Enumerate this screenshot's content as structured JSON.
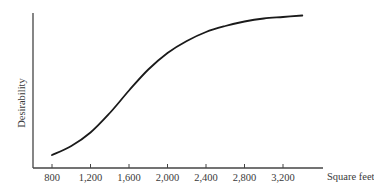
{
  "chart_data": {
    "type": "line",
    "title": "",
    "xlabel": "Square feet",
    "ylabel": "Desirability",
    "x_ticks": [
      800,
      1200,
      1600,
      2000,
      2400,
      2800,
      3200
    ],
    "x_tick_labels": [
      "800",
      "1,200",
      "1,600",
      "2,000",
      "2,400",
      "2,800",
      "3,200"
    ],
    "y_ticks": [],
    "xlim": [
      600,
      3600
    ],
    "ylim": [
      0,
      1
    ],
    "grid": false,
    "legend": null,
    "series": [
      {
        "name": "Desirability",
        "x": [
          800,
          1000,
          1200,
          1400,
          1600,
          1800,
          2000,
          2200,
          2400,
          2600,
          2800,
          3000,
          3200,
          3400
        ],
        "y": [
          0.06,
          0.12,
          0.21,
          0.34,
          0.49,
          0.63,
          0.74,
          0.82,
          0.88,
          0.92,
          0.95,
          0.97,
          0.98,
          0.99
        ]
      }
    ],
    "colors": {
      "line": "#1a1a1a",
      "axis": "#444444",
      "text": "#3a3a3a"
    }
  }
}
